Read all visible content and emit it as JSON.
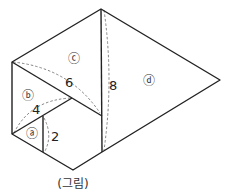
{
  "figure": {
    "caption": "(그림)",
    "regions": [
      {
        "id": "a",
        "label": "ⓐ"
      },
      {
        "id": "b",
        "label": "ⓑ"
      },
      {
        "id": "c",
        "label": "ⓒ"
      },
      {
        "id": "d",
        "label": "ⓓ"
      }
    ],
    "lengths": [
      "2",
      "4",
      "6",
      "8"
    ]
  }
}
